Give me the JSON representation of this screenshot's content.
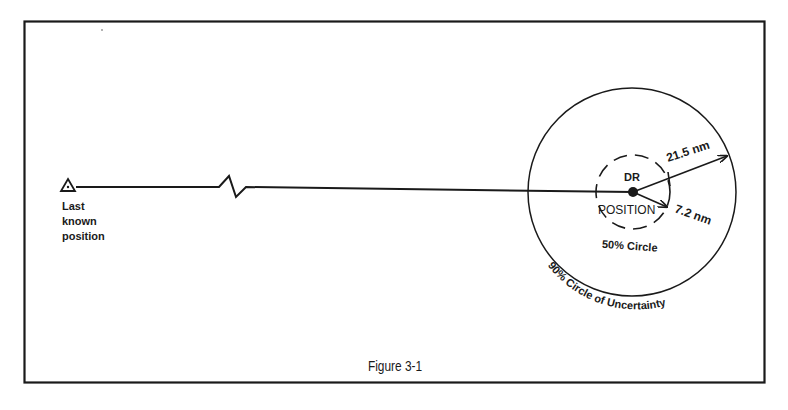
{
  "figure": {
    "caption": "Figure 3-1",
    "start_label": [
      "Last",
      "known",
      "position"
    ],
    "dr_label": "DR",
    "position_label": "POSITION",
    "inner_circle_label": "50% Circle",
    "outer_circle_label": "90% Circle of Uncertainty",
    "outer_radius_label": "21.5 nm",
    "inner_radius_label": "7.2 nm",
    "colors": {
      "ink": "#1a1a1a",
      "background": "#ffffff"
    }
  }
}
